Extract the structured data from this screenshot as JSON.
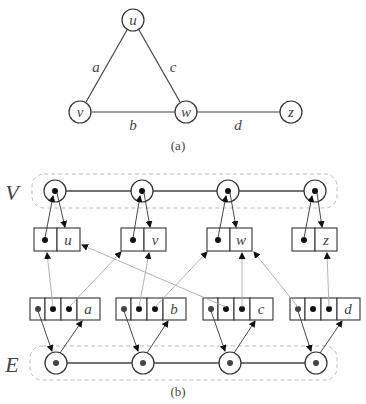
{
  "part_a": {
    "caption": "(a)",
    "vertices": [
      {
        "id": "u",
        "label": "u",
        "x": 133,
        "y": 20
      },
      {
        "id": "v",
        "label": "v",
        "x": 80,
        "y": 112
      },
      {
        "id": "w",
        "label": "w",
        "x": 186,
        "y": 112
      },
      {
        "id": "z",
        "label": "z",
        "x": 291,
        "y": 112
      }
    ],
    "edges": [
      {
        "id": "a",
        "label": "a",
        "from": "v",
        "to": "u"
      },
      {
        "id": "b",
        "label": "b",
        "from": "v",
        "to": "w"
      },
      {
        "id": "c",
        "label": "c",
        "from": "u",
        "to": "w"
      },
      {
        "id": "d",
        "label": "d",
        "from": "w",
        "to": "z"
      }
    ]
  },
  "part_b": {
    "caption": "(b)",
    "vertex_sequence_label": "V",
    "edge_sequence_label": "E",
    "vertex_records": [
      {
        "label": "u"
      },
      {
        "label": "v"
      },
      {
        "label": "w"
      },
      {
        "label": "z"
      }
    ],
    "edge_records": [
      {
        "label": "a",
        "origin": "u",
        "destination": "v"
      },
      {
        "label": "b",
        "origin": "v",
        "destination": "w"
      },
      {
        "label": "c",
        "origin": "u",
        "destination": "w"
      },
      {
        "label": "d",
        "origin": "w",
        "destination": "z"
      }
    ]
  },
  "colors": {
    "stroke": "#333333",
    "pointer_light": "#aaaaaa",
    "dashed_container": "#bbbbbb",
    "text": "#444444"
  }
}
